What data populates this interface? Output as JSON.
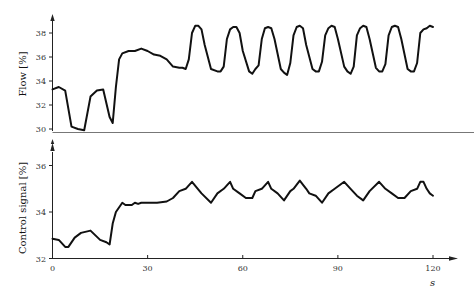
{
  "chart_data": [
    {
      "type": "line",
      "title": "",
      "xlabel": "",
      "ylabel": "Flow [%]",
      "ylim": [
        29.7,
        39.2
      ],
      "xlim": [
        0,
        127
      ],
      "grid": false,
      "yticks": [
        30,
        32,
        34,
        36,
        38
      ],
      "series": [
        {
          "name": "Flow",
          "x": [
            0,
            2,
            4,
            6,
            8,
            10,
            12,
            14,
            16,
            18,
            19,
            20,
            21,
            22,
            24,
            26,
            28,
            30,
            32,
            34,
            36,
            38,
            40,
            41,
            42,
            43,
            44,
            45,
            46,
            47,
            48,
            50,
            52,
            53,
            54,
            55,
            56,
            57,
            58,
            59,
            60,
            62,
            63,
            64,
            65,
            66,
            67,
            68,
            69,
            70,
            72,
            73,
            74,
            75,
            76,
            77,
            78,
            79,
            80,
            82,
            83,
            84,
            85,
            86,
            87,
            88,
            89,
            90,
            92,
            93,
            94,
            95,
            96,
            97,
            98,
            99,
            100,
            102,
            103,
            104,
            105,
            106,
            107,
            108,
            109,
            110,
            112,
            113,
            114,
            115,
            116,
            117,
            118,
            119,
            120
          ],
          "values": [
            33.3,
            33.5,
            33.2,
            30.2,
            30.0,
            29.9,
            32.7,
            33.2,
            33.3,
            31.0,
            30.5,
            33.5,
            35.8,
            36.3,
            36.5,
            36.5,
            36.7,
            36.5,
            36.2,
            36.1,
            35.8,
            35.2,
            35.1,
            35.1,
            35.0,
            35.8,
            38.0,
            38.6,
            38.6,
            38.3,
            37.0,
            35.0,
            34.8,
            34.8,
            35.2,
            37.5,
            38.3,
            38.5,
            38.5,
            38.0,
            36.5,
            34.8,
            34.6,
            35.0,
            35.3,
            37.5,
            38.4,
            38.5,
            38.4,
            37.5,
            35.0,
            34.7,
            34.5,
            35.5,
            37.8,
            38.5,
            38.6,
            38.4,
            37.0,
            35.0,
            34.8,
            34.8,
            35.6,
            37.8,
            38.4,
            38.6,
            38.5,
            37.5,
            35.2,
            34.8,
            34.6,
            35.2,
            37.8,
            38.4,
            38.6,
            38.5,
            37.5,
            35.1,
            34.8,
            34.8,
            35.4,
            37.8,
            38.5,
            38.6,
            38.5,
            37.5,
            35.0,
            34.8,
            34.8,
            35.5,
            38.0,
            38.3,
            38.4,
            38.6,
            38.5
          ]
        }
      ]
    },
    {
      "type": "line",
      "title": "",
      "xlabel": "s",
      "ylabel": "Control signal [%]",
      "ylim": [
        32,
        37.1
      ],
      "xlim": [
        0,
        127
      ],
      "grid": false,
      "xticks": [
        0,
        30,
        60,
        90,
        120
      ],
      "yticks": [
        32,
        34,
        36
      ],
      "series": [
        {
          "name": "Control signal",
          "x": [
            0,
            2,
            4,
            5,
            7,
            9,
            12,
            15,
            17,
            18,
            19,
            20,
            22,
            23,
            25,
            26,
            27,
            28,
            30,
            33,
            36,
            38,
            40,
            42,
            44,
            47,
            50,
            52,
            54,
            56,
            57,
            59,
            61,
            63,
            64,
            66,
            68,
            69,
            71,
            73,
            75,
            76,
            78,
            80,
            81,
            83,
            85,
            87,
            89,
            92,
            94,
            96,
            98,
            100,
            103,
            105,
            107,
            109,
            111,
            113,
            115,
            116,
            117,
            118,
            119,
            120
          ],
          "values": [
            32.85,
            32.8,
            32.5,
            32.5,
            32.9,
            33.1,
            33.2,
            32.8,
            32.7,
            32.6,
            33.5,
            34.0,
            34.4,
            34.3,
            34.3,
            34.4,
            34.35,
            34.4,
            34.4,
            34.4,
            34.45,
            34.6,
            34.9,
            35.0,
            35.3,
            34.8,
            34.4,
            34.8,
            35.0,
            35.3,
            35.0,
            34.8,
            34.6,
            34.6,
            34.9,
            35.0,
            35.3,
            35.0,
            34.8,
            34.5,
            34.9,
            35.0,
            35.35,
            35.0,
            34.8,
            34.7,
            34.4,
            34.8,
            35.0,
            35.3,
            35.0,
            34.7,
            34.5,
            34.9,
            35.3,
            35.0,
            34.8,
            34.6,
            34.6,
            34.9,
            35.0,
            35.3,
            35.3,
            35.0,
            34.8,
            34.7
          ]
        }
      ]
    }
  ],
  "labels": {
    "top_ylabel": "Flow [%]",
    "bottom_ylabel": "Control signal [%]",
    "x_unit": "s",
    "top_yticks": [
      "38",
      "36",
      "34",
      "32",
      "30"
    ],
    "bottom_yticks": [
      "36",
      "34",
      "32"
    ],
    "xticks": [
      "0",
      "30",
      "60",
      "90",
      "120"
    ]
  }
}
